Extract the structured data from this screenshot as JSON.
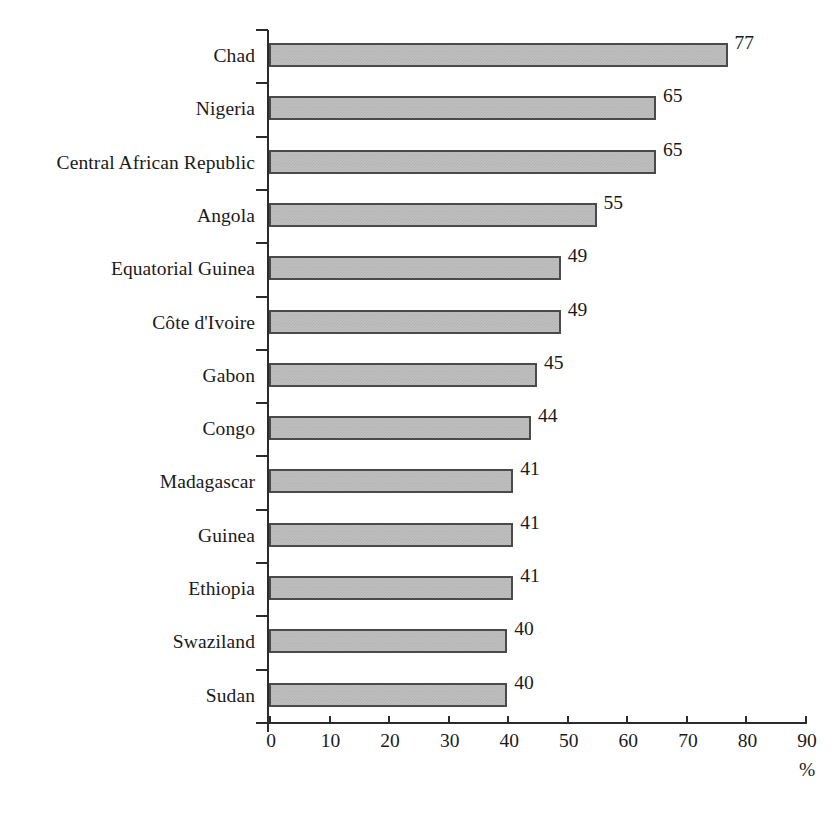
{
  "chart_data": {
    "type": "bar",
    "orientation": "horizontal",
    "title": "",
    "xlabel": "%",
    "ylabel": "",
    "xlim": [
      0,
      90
    ],
    "xticks": [
      0,
      10,
      20,
      30,
      40,
      50,
      60,
      70,
      80,
      90
    ],
    "grid": false,
    "legend": null,
    "bar_fill_color": "#c0c0c0",
    "bar_border_color": "#4a4a4a",
    "text_color": "#1a1a1a",
    "categories": [
      "Chad",
      "Nigeria",
      "Central African Republic",
      "Angola",
      "Equatorial Guinea",
      "Côte d'Ivoire",
      "Gabon",
      "Congo",
      "Madagascar",
      "Guinea",
      "Ethiopia",
      "Swaziland",
      "Sudan"
    ],
    "values": [
      77,
      65,
      65,
      55,
      49,
      49,
      45,
      44,
      41,
      41,
      41,
      40,
      40
    ],
    "data_labels": [
      "77",
      "65",
      "65",
      "55",
      "49",
      "49",
      "45",
      "44",
      "41",
      "41",
      "41",
      "40",
      "40"
    ],
    "xtick_labels": [
      "0",
      "10",
      "20",
      "30",
      "40",
      "50",
      "60",
      "70",
      "80",
      "90"
    ],
    "unit_label": "%"
  }
}
